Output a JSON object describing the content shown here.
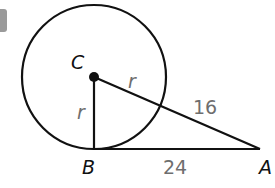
{
  "diagram": {
    "type": "geometry",
    "points": {
      "C": {
        "label": "C",
        "x": 94,
        "y": 77
      },
      "B": {
        "label": "B",
        "x": 94,
        "y": 149
      },
      "A": {
        "label": "A",
        "x": 260,
        "y": 149
      }
    },
    "circle": {
      "center": "C",
      "radius_px": 72,
      "stroke": "#111111"
    },
    "segments": [
      {
        "from": "C",
        "to": "B",
        "label": "r"
      },
      {
        "from": "C",
        "to": "A",
        "label_near_C": "r",
        "label_outside": "16"
      },
      {
        "from": "B",
        "to": "A",
        "label": "24"
      }
    ],
    "labels": {
      "C": "C",
      "B": "B",
      "A": "A",
      "r_vertical": "r",
      "r_slanted": "r",
      "external_segment": "16",
      "tangent_length": "24"
    },
    "colors": {
      "stroke": "#111111",
      "measure_text": "#6e6e6e",
      "badge": "#9a9a9a"
    }
  }
}
